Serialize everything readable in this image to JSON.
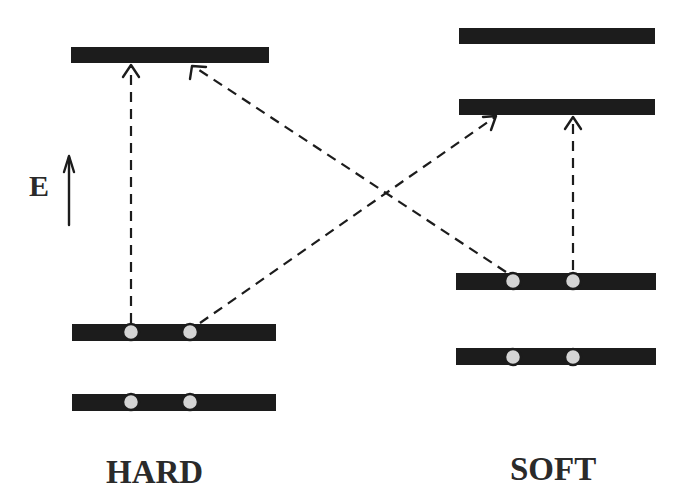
{
  "diagram": {
    "energy_axis_label": "E",
    "groups": [
      {
        "name": "HARD",
        "label": "HARD"
      },
      {
        "name": "SOFT",
        "label": "SOFT"
      }
    ],
    "colors": {
      "level": "#1c1c1c",
      "electron_fill": "#d4d4d4",
      "electron_stroke": "#1c1c1c",
      "arrow": "#1c1c1c"
    },
    "levels": {
      "hard": [
        {
          "id": "hard-empty",
          "occupied": false
        },
        {
          "id": "hard-homo",
          "occupied": true,
          "electrons": 2
        },
        {
          "id": "hard-low",
          "occupied": true,
          "electrons": 2
        }
      ],
      "soft": [
        {
          "id": "soft-empty-high",
          "occupied": false
        },
        {
          "id": "soft-lumo",
          "occupied": false
        },
        {
          "id": "soft-homo",
          "occupied": true,
          "electrons": 2
        },
        {
          "id": "soft-low",
          "occupied": true,
          "electrons": 2
        }
      ]
    },
    "transitions": [
      {
        "from": "hard-homo",
        "to": "hard-empty",
        "style": "dashed"
      },
      {
        "from": "hard-homo",
        "to": "soft-lumo",
        "style": "dashed"
      },
      {
        "from": "soft-homo",
        "to": "hard-empty",
        "style": "dashed"
      },
      {
        "from": "soft-homo",
        "to": "soft-lumo",
        "style": "dashed"
      }
    ]
  }
}
